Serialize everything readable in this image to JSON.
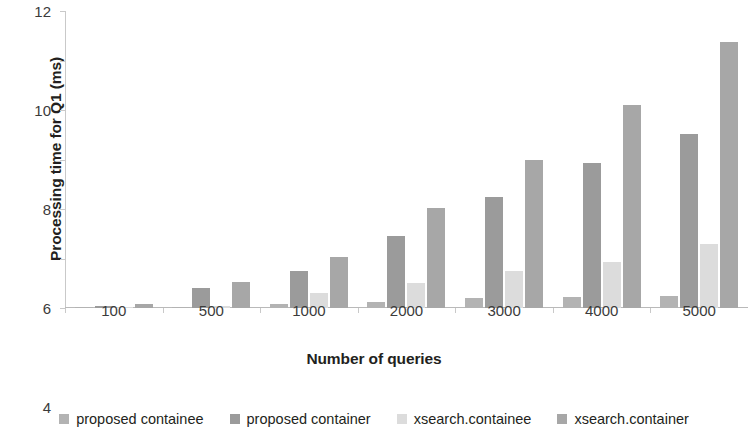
{
  "chart_data": {
    "type": "bar",
    "title": "",
    "xlabel": "Number of queries",
    "ylabel": "Processing time for Q1 (ms)",
    "categories": [
      "100",
      "500",
      "1000",
      "2000",
      "3000",
      "4000",
      "5000"
    ],
    "ylim": [
      0,
      12
    ],
    "yticks": [
      0,
      2,
      4,
      6,
      8,
      10,
      12
    ],
    "ytick_labels": [
      "0",
      "2",
      "4",
      "6",
      "8",
      "10",
      "12"
    ],
    "grid": false,
    "legend_position": "bottom",
    "series": [
      {
        "name": "proposed containee",
        "color": "#b3b3b3",
        "values": [
          0.02,
          0.05,
          0.15,
          0.25,
          0.4,
          0.45,
          0.5
        ]
      },
      {
        "name": "proposed container",
        "color": "#9b9b9b",
        "values": [
          0.1,
          0.8,
          1.5,
          2.9,
          4.5,
          5.85,
          7.05
        ]
      },
      {
        "name": "xsearch.containee",
        "color": "#dcdcdc",
        "values": [
          0.03,
          0.1,
          0.6,
          1.0,
          1.5,
          1.85,
          2.6
        ]
      },
      {
        "name": "xsearch.container",
        "color": "#a7a7a7",
        "values": [
          0.15,
          1.05,
          2.05,
          4.05,
          6.0,
          8.2,
          10.75
        ]
      }
    ]
  }
}
